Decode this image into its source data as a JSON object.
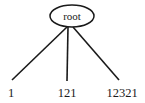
{
  "figure": {
    "type": "tree-diagram",
    "background_color": "#ffffff",
    "line_color": "#1a1a1a",
    "node_fill": "#ffffff"
  },
  "root_node": {
    "label": "root",
    "shape": "ellipse",
    "center_x": 72,
    "center_y": 16,
    "radius_x": 22,
    "radius_y": 11
  },
  "edges": [
    {
      "name": "edge-root-to-leaf-1",
      "x1": 67,
      "y1": 27,
      "x2": 12,
      "y2": 80
    },
    {
      "name": "edge-root-to-leaf-121",
      "x1": 68,
      "y1": 27,
      "x2": 67,
      "y2": 81
    },
    {
      "name": "edge-root-to-leaf-12321",
      "x1": 73,
      "y1": 27,
      "x2": 119,
      "y2": 80
    }
  ],
  "leaves": [
    {
      "label": "1",
      "x": 8,
      "y": 97,
      "anchor": "start"
    },
    {
      "label": "121",
      "x": 67,
      "y": 97,
      "anchor": "middle"
    },
    {
      "label": "12321",
      "x": 122,
      "y": 97,
      "anchor": "middle"
    }
  ]
}
